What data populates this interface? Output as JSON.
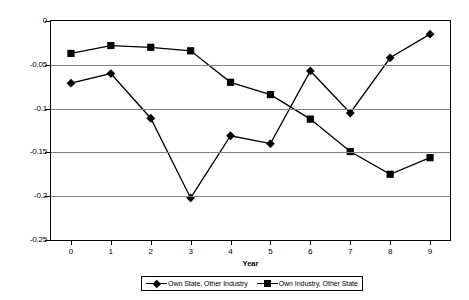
{
  "chart_data": {
    "type": "line",
    "title": "",
    "xlabel": "Year",
    "ylabel": "Effect of Shock on Wages (percent)",
    "x": [
      0,
      1,
      2,
      3,
      4,
      5,
      6,
      7,
      8,
      9
    ],
    "categories": [
      "0",
      "1",
      "2",
      "3",
      "4",
      "5",
      "6",
      "7",
      "8",
      "9"
    ],
    "xlim": [
      -0.5,
      9.5
    ],
    "ylim": [
      -0.25,
      0
    ],
    "yticks": [
      0,
      -0.05,
      -0.1,
      -0.15,
      -0.2,
      -0.25
    ],
    "ytick_labels": [
      "0",
      "-0.05",
      "-0.1",
      "-0.15",
      "-0.2",
      "-0.25"
    ],
    "grid": "horizontal",
    "legend_position": "bottom",
    "series": [
      {
        "name": "Own State, Other Industry",
        "marker": "diamond",
        "color": "#000000",
        "values": [
          -0.071,
          -0.06,
          -0.111,
          -0.202,
          -0.131,
          -0.14,
          -0.057,
          -0.105,
          -0.042,
          -0.015
        ]
      },
      {
        "name": "Own Industry, Other State",
        "marker": "square",
        "color": "#000000",
        "values": [
          -0.037,
          -0.028,
          -0.03,
          -0.034,
          -0.07,
          -0.084,
          -0.112,
          -0.149,
          -0.175,
          -0.156
        ]
      }
    ]
  },
  "axes": {
    "y_title": "Effect of Shock on Wages (percent)",
    "x_title": "Year"
  },
  "legend": {
    "entries": [
      {
        "label": "Own State, Other Industry",
        "marker": "diamond"
      },
      {
        "label": "Own Industry, Other State",
        "marker": "square"
      }
    ]
  }
}
